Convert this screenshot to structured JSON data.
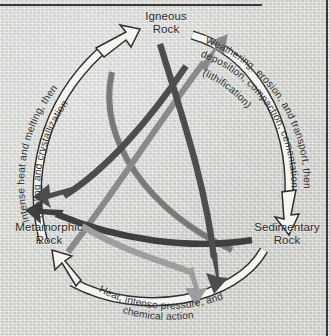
{
  "diagram": {
    "type": "cycle-diagram",
    "background_color": "#d7d7d3",
    "nodes": [
      {
        "id": "igneous",
        "label_line1": "Igneous",
        "label_line2": "Rock",
        "position": "top"
      },
      {
        "id": "metamorphic",
        "label_line1": "Metamorphic",
        "label_line2": "Rock",
        "position": "bottom-left"
      },
      {
        "id": "sedimentary",
        "label_line1": "Sedimentary",
        "label_line2": "Rock",
        "position": "bottom-right"
      }
    ],
    "outer_arcs": [
      {
        "id": "metamorphic-to-igneous",
        "from": "metamorphic",
        "to": "igneous",
        "side": "left",
        "style": "white-outlined",
        "color": "#f2f2ee",
        "outline_color": "#2f2f2f",
        "line1": "Intense heat and melting, then",
        "line2": "cooling and crystallization"
      },
      {
        "id": "igneous-to-sedimentary",
        "from": "igneous",
        "to": "sedimentary",
        "side": "right",
        "style": "white-outlined",
        "color": "#f2f2ee",
        "outline_color": "#2f2f2f",
        "line1": "Weathering, erosion, and transport, then",
        "line2": "deposition, compaction, cementation",
        "line3": "(lithification)"
      },
      {
        "id": "sedimentary-to-metamorphic",
        "from": "sedimentary",
        "to": "metamorphic",
        "side": "bottom",
        "style": "white-outlined",
        "color": "#f2f2ee",
        "outline_color": "#2f2f2f",
        "line1": "Heat, intense pressure, and",
        "line2": "chemical action"
      }
    ],
    "inner_arrows": [
      {
        "id": "sedimentary-to-igneous",
        "from": "sedimentary",
        "to": "igneous",
        "color": "#7d7d7d",
        "tone": "medium-gray"
      },
      {
        "id": "metamorphic-to-igneous-inner",
        "from": "metamorphic",
        "to": "igneous",
        "color": "#4a4a4a",
        "tone": "dark-gray"
      },
      {
        "id": "igneous-to-metamorphic",
        "from": "igneous",
        "to": "metamorphic",
        "color": "#7d7d7d",
        "tone": "medium-gray"
      },
      {
        "id": "sedimentary-to-metamorphic-inner",
        "from": "sedimentary",
        "to": "metamorphic",
        "color": "#4a4a4a",
        "tone": "dark-gray"
      },
      {
        "id": "igneous-to-sedimentary-inner",
        "from": "igneous",
        "to": "sedimentary",
        "color": "#4a4a4a",
        "tone": "dark-gray"
      },
      {
        "id": "metamorphic-to-sedimentary",
        "from": "metamorphic",
        "to": "sedimentary",
        "color": "#9a9a9a",
        "tone": "light-gray"
      }
    ],
    "palette": {
      "background": "#d7d7d3",
      "text": "#2b2b2b",
      "outline": "#2f2f2f",
      "arrow_white": "#f2f2ee",
      "arrow_medium": "#7d7d7d",
      "arrow_dark": "#4a4a4a",
      "border": "#3a3a3a"
    }
  }
}
